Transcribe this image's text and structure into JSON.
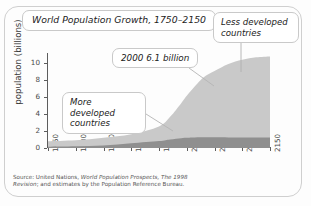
{
  "figure": {
    "title": "World Population Growth, 1750–2150",
    "source_line1_prefix": "Source: United Nations, ",
    "source_line1_italic": "World Population Prospects, The 1998",
    "source_line2_italic": "Revision",
    "source_line2_suffix": "; and estimates by the Population Reference Bureau."
  },
  "callouts": {
    "less_developed": "Less developed countries",
    "more_developed": "More developed countries",
    "annotation_2000": "2000 6.1 billion"
  },
  "colors": {
    "less_developed_fill": "#c9c9c9",
    "more_developed_fill": "#8f8f8f",
    "axis": "#5d5d5d",
    "frame_border": "#cfcfcf",
    "callout_border": "#c9c9c9",
    "background": "#fdfdfd",
    "text": "#1c1c1c"
  },
  "chart_data": {
    "type": "area",
    "stacked": true,
    "title": "World Population Growth, 1750–2150",
    "xlabel": "",
    "ylabel": "population (billions)",
    "xlim": [
      1750,
      2150
    ],
    "ylim": [
      0,
      11
    ],
    "grid": false,
    "legend": "callout-labels",
    "xticks": [
      1750,
      1800,
      1850,
      1900,
      1950,
      2000,
      2050,
      2100,
      2150
    ],
    "yticks": [
      0,
      2,
      4,
      6,
      8,
      10
    ],
    "xtick_labels": [
      "1750",
      "1800",
      "1850",
      "1900",
      "1950",
      "2000",
      "2050",
      "2100",
      "2150"
    ],
    "ytick_labels": [
      "0",
      "2",
      "4",
      "6",
      "8",
      "10"
    ],
    "x": [
      1750,
      1800,
      1850,
      1900,
      1950,
      1970,
      1990,
      2000,
      2010,
      2030,
      2050,
      2075,
      2100,
      2125,
      2150
    ],
    "series": [
      {
        "name": "More developed countries",
        "color": "#8f8f8f",
        "values": [
          0.15,
          0.2,
          0.3,
          0.55,
          0.81,
          1.0,
          1.15,
          1.19,
          1.22,
          1.25,
          1.25,
          1.24,
          1.23,
          1.22,
          1.22
        ]
      },
      {
        "name": "Less developed countries",
        "color": "#c9c9c9",
        "values": [
          0.64,
          0.7,
          0.9,
          1.07,
          1.71,
          2.65,
          4.1,
          4.91,
          5.65,
          7.0,
          7.75,
          8.6,
          9.1,
          9.4,
          9.5
        ]
      }
    ],
    "totals": [
      0.79,
      0.9,
      1.2,
      1.62,
      2.52,
      3.65,
      5.25,
      6.1,
      6.87,
      8.25,
      9.0,
      9.84,
      10.33,
      10.62,
      10.72
    ],
    "annotations": [
      {
        "text": "2000 6.1 billion",
        "x": 2000,
        "y": 6.1
      },
      {
        "text": "Less developed countries",
        "x": 2095,
        "y": 9.3
      },
      {
        "text": "More developed countries",
        "x": 1975,
        "y": 1.2
      }
    ]
  }
}
